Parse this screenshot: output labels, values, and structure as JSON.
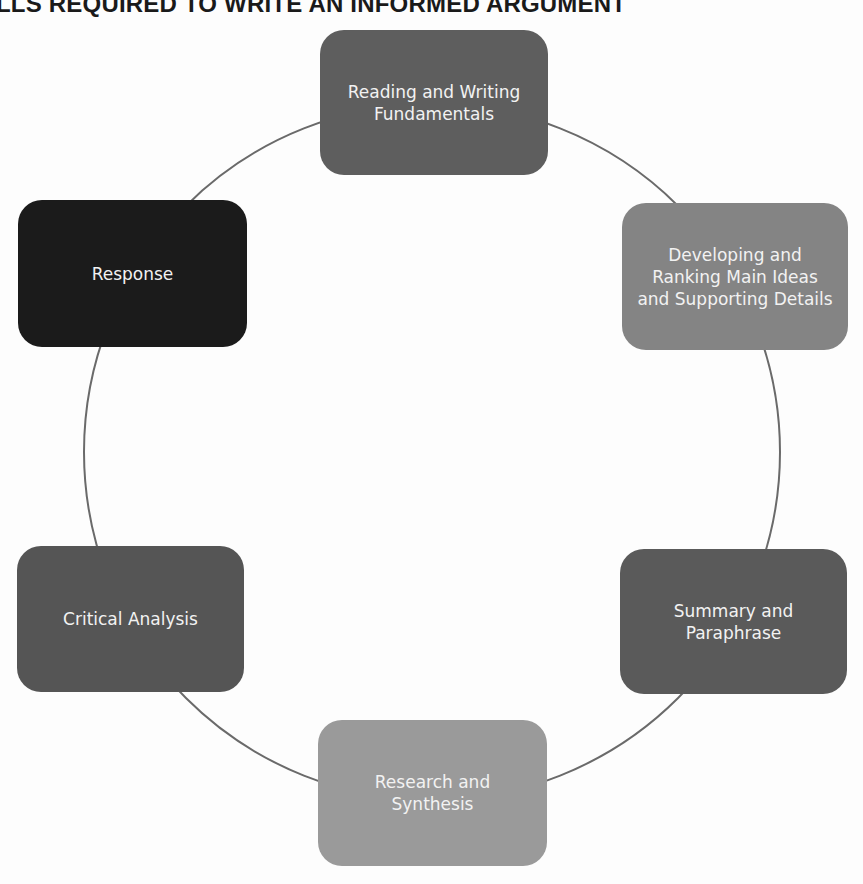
{
  "title": "LLS REQUIRED TO WRITE AN INFORMED ARGUMENT",
  "ring": {
    "cx": 432,
    "cy": 452,
    "r": 348,
    "stroke": "#6a6a6a"
  },
  "nodes": [
    {
      "label": "Reading and Writing Fundamentals",
      "color": "#5e5e5e"
    },
    {
      "label": "Developing and Ranking Main Ideas and Supporting Details",
      "color": "#848484"
    },
    {
      "label": "Summary and Paraphrase",
      "color": "#5a5a5a"
    },
    {
      "label": "Research and Synthesis",
      "color": "#9a9a9a"
    },
    {
      "label": "Critical Analysis",
      "color": "#555555"
    },
    {
      "label": "Response",
      "color": "#1b1b1b"
    }
  ]
}
